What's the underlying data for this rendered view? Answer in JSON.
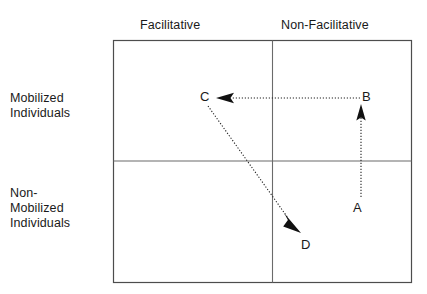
{
  "diagram": {
    "columns": [
      {
        "id": "facilitative",
        "label": "Facilitative"
      },
      {
        "id": "non-facilitative",
        "label": "Non-Facilitative"
      }
    ],
    "rows": [
      {
        "id": "mobilized",
        "label": "Mobilized\nIndividuals",
        "line1": "Mobilized",
        "line2": "Individuals",
        "line3": ""
      },
      {
        "id": "non-mobilized",
        "label": "Non-Mobilized Individuals",
        "line1": "Non-",
        "line2": "Mobilized",
        "line3": "Individuals"
      }
    ],
    "points": [
      {
        "id": "a",
        "label": "A",
        "quadrant": "non-facilitative / non-mobilized",
        "x": 361,
        "y": 207
      },
      {
        "id": "b",
        "label": "B",
        "quadrant": "non-facilitative / mobilized",
        "x": 368,
        "y": 97
      },
      {
        "id": "c",
        "label": "C",
        "quadrant": "facilitative / mobilized",
        "x": 206,
        "y": 97
      },
      {
        "id": "d",
        "label": "D",
        "quadrant": "facilitative / non-mobilized",
        "x": 307,
        "y": 244
      }
    ],
    "arrows": [
      {
        "id": "a-to-b",
        "from": "A",
        "to": "B",
        "style": "dotted",
        "head": "solid-triangle"
      },
      {
        "id": "b-to-c",
        "from": "B",
        "to": "C",
        "style": "dotted",
        "head": "solid-triangle"
      },
      {
        "id": "c-to-d",
        "from": "C",
        "to": "D",
        "style": "dotted",
        "head": "solid-triangle"
      }
    ],
    "colors": {
      "background": "#ffffff",
      "border": "#4d4d4d",
      "divider": "#6b6b6b",
      "arrow": "#111111",
      "text": "#1a1a1a"
    },
    "frame": {
      "left": 113,
      "top": 40,
      "right": 412,
      "bottom": 283,
      "v_divider_x": 272,
      "h_divider_y": 161
    }
  }
}
